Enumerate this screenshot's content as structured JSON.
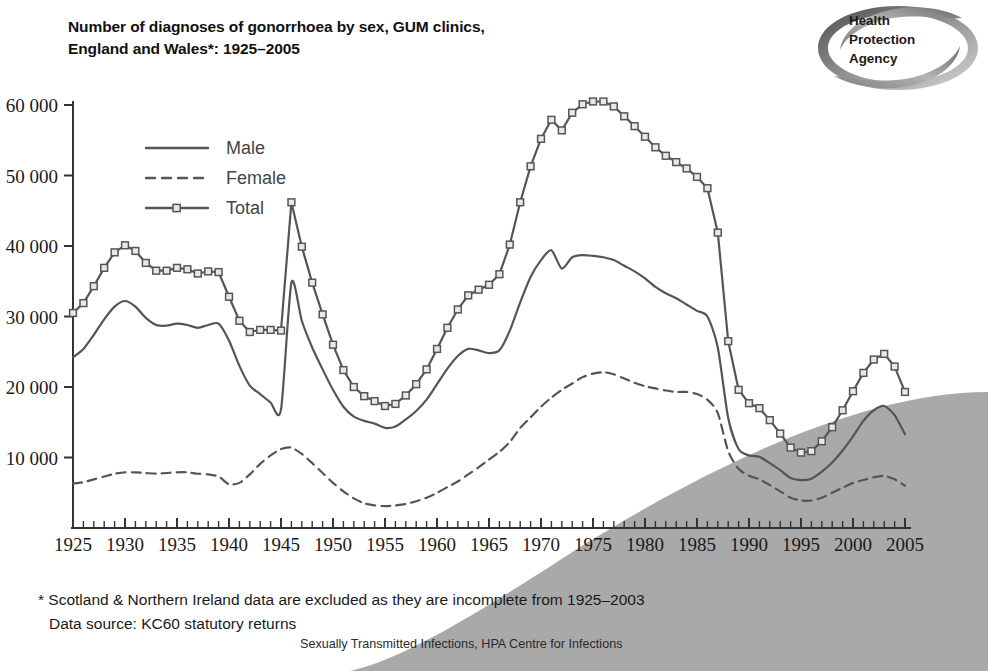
{
  "title": {
    "line1": "Number of diagnoses of gonorrhoea by sex, GUM clinics,",
    "line2": "England and Wales*: 1925–2005"
  },
  "logo": {
    "line1": "Health",
    "line2": "Protection",
    "line3": "Agency",
    "name": "health-protection-agency-logo"
  },
  "footnotes": {
    "note": "* Scotland & Northern Ireland data are excluded as they are incomplete from 1925–2003",
    "source": "Data source: KC60 statutory returns",
    "credit": "Sexually Transmitted Infections, HPA Centre for Infections"
  },
  "colors": {
    "line": "#555555",
    "axis": "#333333",
    "swoosh": "#a8a8a8",
    "text": "#1a1a1a"
  },
  "chart_data": {
    "type": "line",
    "title": "Number of diagnoses of gonorrhoea by sex, GUM clinics, England and Wales*: 1925–2005",
    "xlabel": "",
    "ylabel": "",
    "xlim": [
      1925,
      2005
    ],
    "ylim": [
      0,
      60000
    ],
    "grid": false,
    "legend_position": "upper-left",
    "ytick_labels": [
      "10 000",
      "20 000",
      "30 000",
      "40 000",
      "50 000",
      "60 000"
    ],
    "yticks": [
      10000,
      20000,
      30000,
      40000,
      50000,
      60000
    ],
    "xtick_labels": [
      "1925",
      "1930",
      "1935",
      "1940",
      "1945",
      "1950",
      "1955",
      "1960",
      "1965",
      "1970",
      "1975",
      "1980",
      "1985",
      "1990",
      "1995",
      "2000",
      "2005"
    ],
    "xticks": [
      1925,
      1930,
      1935,
      1940,
      1945,
      1950,
      1955,
      1960,
      1965,
      1970,
      1975,
      1980,
      1985,
      1990,
      1995,
      2000,
      2005
    ],
    "minor_xtick_interval": 1,
    "x": [
      1925,
      1926,
      1927,
      1928,
      1929,
      1930,
      1931,
      1932,
      1933,
      1934,
      1935,
      1936,
      1937,
      1938,
      1939,
      1940,
      1941,
      1942,
      1943,
      1944,
      1945,
      1946,
      1947,
      1948,
      1949,
      1950,
      1951,
      1952,
      1953,
      1954,
      1955,
      1956,
      1957,
      1958,
      1959,
      1960,
      1961,
      1962,
      1963,
      1964,
      1965,
      1966,
      1967,
      1968,
      1969,
      1970,
      1971,
      1972,
      1973,
      1974,
      1975,
      1976,
      1977,
      1978,
      1979,
      1980,
      1981,
      1982,
      1983,
      1984,
      1985,
      1986,
      1987,
      1988,
      1989,
      1990,
      1991,
      1992,
      1993,
      1994,
      1995,
      1996,
      1997,
      1998,
      1999,
      2000,
      2001,
      2002,
      2003,
      2004,
      2005
    ],
    "series": [
      {
        "name": "Male",
        "style": "solid",
        "markers": false,
        "values": [
          24200,
          25400,
          27400,
          29600,
          31400,
          32200,
          31400,
          29800,
          28800,
          28700,
          29000,
          28800,
          28400,
          28800,
          29000,
          26600,
          23000,
          20200,
          19000,
          17800,
          16800,
          34800,
          29400,
          25600,
          22500,
          19600,
          17200,
          15800,
          15200,
          14800,
          14200,
          14400,
          15400,
          16600,
          18200,
          20400,
          22600,
          24400,
          25400,
          25200,
          24800,
          25200,
          28000,
          32000,
          35600,
          38000,
          39400,
          36800,
          38400,
          38700,
          38600,
          38400,
          38000,
          37200,
          36400,
          35400,
          34200,
          33300,
          32600,
          31700,
          30800,
          30000,
          25600,
          15600,
          11200,
          10300,
          10100,
          9200,
          8200,
          7100,
          6800,
          7000,
          8000,
          9300,
          11000,
          13000,
          15200,
          16700,
          17300,
          16000,
          13300
        ]
      },
      {
        "name": "Female",
        "style": "dashed",
        "markers": false,
        "values": [
          6300,
          6500,
          6900,
          7300,
          7700,
          7900,
          7900,
          7800,
          7700,
          7800,
          7900,
          7900,
          7700,
          7600,
          7300,
          6200,
          6400,
          7600,
          9100,
          10300,
          11200,
          11400,
          10500,
          9200,
          7800,
          6400,
          5200,
          4200,
          3500,
          3200,
          3100,
          3200,
          3400,
          3800,
          4300,
          5000,
          5800,
          6600,
          7600,
          8600,
          9700,
          10800,
          12200,
          14200,
          15700,
          17200,
          18500,
          19600,
          20500,
          21400,
          21900,
          22100,
          21800,
          21200,
          20600,
          20100,
          19800,
          19500,
          19300,
          19300,
          19000,
          18200,
          16300,
          10900,
          8400,
          7400,
          6900,
          6100,
          5200,
          4300,
          3900,
          3900,
          4300,
          5000,
          5700,
          6400,
          6800,
          7200,
          7400,
          6900,
          6000
        ]
      },
      {
        "name": "Total",
        "style": "solid",
        "markers": true,
        "values": [
          30500,
          31900,
          34300,
          36900,
          39100,
          40100,
          39300,
          37600,
          36500,
          36500,
          36900,
          36700,
          36100,
          36400,
          36300,
          32800,
          29400,
          27800,
          28100,
          28100,
          28000,
          46200,
          39900,
          34800,
          30300,
          26000,
          22400,
          20000,
          18700,
          18000,
          17300,
          17600,
          18800,
          20400,
          22500,
          25400,
          28400,
          31000,
          33000,
          33800,
          34500,
          36000,
          40200,
          46200,
          51300,
          55200,
          57900,
          56400,
          58900,
          60100,
          60500,
          60500,
          59800,
          58400,
          57000,
          55500,
          54000,
          52800,
          51900,
          51000,
          49800,
          48200,
          41900,
          26500,
          19600,
          17700,
          17000,
          15300,
          13400,
          11400,
          10700,
          10900,
          12300,
          14300,
          16700,
          19400,
          22000,
          23900,
          24700,
          22900,
          19300
        ]
      }
    ]
  },
  "legend": {
    "items": [
      {
        "label": "Male",
        "style": "solid",
        "marker": false
      },
      {
        "label": "Female",
        "style": "dashed",
        "marker": false
      },
      {
        "label": "Total",
        "style": "solid",
        "marker": true
      }
    ]
  }
}
